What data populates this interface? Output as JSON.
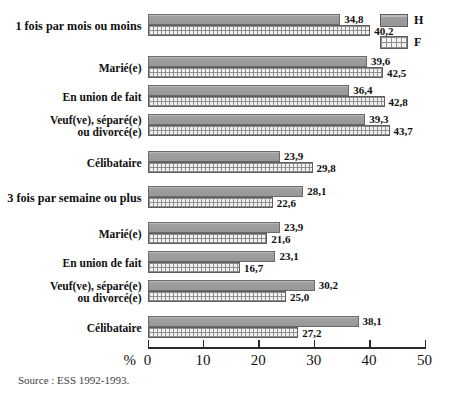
{
  "chart_data": {
    "type": "bar",
    "orientation": "horizontal",
    "title": "",
    "xlabel": "%",
    "ylabel": "",
    "xlim": [
      0,
      50
    ],
    "xticks": [
      0,
      10,
      20,
      30,
      40,
      50
    ],
    "grid": false,
    "legend_position": "top-right",
    "legend": [
      {
        "key": "H",
        "label": "H",
        "style": "solid-gray"
      },
      {
        "key": "F",
        "label": "F",
        "style": "dotted-hatch"
      }
    ],
    "series": [
      {
        "name": "H",
        "values": [
          34.8,
          39.6,
          36.4,
          39.3,
          23.9,
          28.1,
          23.9,
          23.1,
          30.2,
          38.1
        ]
      },
      {
        "name": "F",
        "values": [
          40.2,
          42.5,
          42.8,
          43.7,
          29.8,
          22.6,
          21.6,
          16.7,
          25.0,
          27.2
        ]
      }
    ],
    "groups": [
      {
        "header": "1 fois par mois ou moins",
        "is_header_row": true,
        "rows": [
          {
            "label": "1 fois par mois ou moins",
            "is_header": true,
            "H": 34.8,
            "F": 40.2,
            "H_label": "34,8",
            "F_label": "40,2"
          },
          {
            "label": "Marié(e)",
            "is_header": false,
            "H": 39.6,
            "F": 42.5,
            "H_label": "39,6",
            "F_label": "42,5"
          },
          {
            "label": "En union de fait",
            "is_header": false,
            "H": 36.4,
            "F": 42.8,
            "H_label": "36,4",
            "F_label": "42,8"
          },
          {
            "label": "Veuf(ve), séparé(e)\nou divorcé(e)",
            "is_header": false,
            "H": 39.3,
            "F": 43.7,
            "H_label": "39,3",
            "F_label": "43,7"
          },
          {
            "label": "Célibataire",
            "is_header": false,
            "H": 23.9,
            "F": 29.8,
            "H_label": "23,9",
            "F_label": "29,8"
          }
        ]
      },
      {
        "header": "3 fois par semaine ou plus",
        "is_header_row": true,
        "rows": [
          {
            "label": "3 fois par semaine ou plus",
            "is_header": true,
            "H": 28.1,
            "F": 22.6,
            "H_label": "28,1",
            "F_label": "22,6"
          },
          {
            "label": "Marié(e)",
            "is_header": false,
            "H": 23.9,
            "F": 21.6,
            "H_label": "23,9",
            "F_label": "21,6"
          },
          {
            "label": "En union de fait",
            "is_header": false,
            "H": 23.1,
            "F": 16.7,
            "H_label": "23,1",
            "F_label": "16,7"
          },
          {
            "label": "Veuf(ve), séparé(e)\nou divorcé(e)",
            "is_header": false,
            "H": 30.2,
            "F": 25.0,
            "H_label": "30,2",
            "F_label": "25,0"
          },
          {
            "label": "Célibataire",
            "is_header": false,
            "H": 38.1,
            "F": 27.2,
            "H_label": "38,1",
            "F_label": "27,2"
          }
        ]
      }
    ]
  },
  "axis": {
    "unit": "%",
    "ticks": [
      "0",
      "10",
      "20",
      "30",
      "40",
      "50"
    ]
  },
  "legend": {
    "items": [
      {
        "label": "H"
      },
      {
        "label": "F"
      }
    ]
  },
  "source": {
    "text": "Source : ESS 1992-1993."
  },
  "colors": {
    "bar_h_fill": "#9d9d9d",
    "bar_f_fill": "#f2f2f2",
    "bar_stroke": "#5d5d5d",
    "axis": "#2a2a2a",
    "text": "#0f0f0f",
    "source_text": "#3d3d3d",
    "background": "#ffffff"
  }
}
